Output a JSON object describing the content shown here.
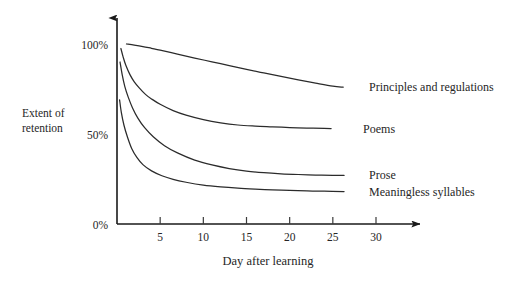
{
  "chart_data": {
    "type": "line",
    "title": "",
    "xlabel": "Day after learning",
    "ylabel_line1": "Extent of",
    "ylabel_line2": "retention",
    "xtick_labels": [
      "5",
      "10",
      "15",
      "20",
      "25",
      "30"
    ],
    "xticks": [
      5,
      10,
      15,
      20,
      25,
      30
    ],
    "ytick_labels": [
      "100%",
      "50%",
      "0%"
    ],
    "yticks": [
      100,
      50,
      0
    ],
    "xlim": [
      0,
      33
    ],
    "ylim": [
      0,
      100
    ],
    "grid": false,
    "legend_position": "right-inline",
    "axis_color": "#1a1a1a",
    "curve_color": "#2b2b2b",
    "background": "#ffffff",
    "series": [
      {
        "name": "Principles and regulations",
        "label": "Principles and regulations",
        "label_x": 29.2,
        "label_y": 76,
        "x": [
          1.1,
          2,
          3,
          4,
          5,
          7,
          9,
          11,
          13,
          15,
          17,
          19,
          21,
          23,
          25,
          26.2
        ],
        "values": [
          100,
          99.4,
          98.6,
          97.6,
          96.6,
          94.4,
          92.2,
          90.1,
          88,
          85.9,
          83.9,
          82,
          80.1,
          78.3,
          76.6,
          76
        ]
      },
      {
        "name": "Poems",
        "label": "Poems",
        "label_x": 28.5,
        "label_y": 53,
        "x": [
          0.45,
          0.7,
          1,
          1.5,
          2,
          2.6,
          3.3,
          4,
          5,
          6.5,
          8,
          10,
          12,
          14,
          16,
          18,
          20,
          22,
          24,
          24.8
        ],
        "values": [
          97.5,
          93,
          88.5,
          83,
          79,
          75.5,
          72,
          69.5,
          66.5,
          63,
          60.5,
          58,
          56.2,
          55,
          54.4,
          54,
          53.6,
          53.3,
          53.1,
          53
        ]
      },
      {
        "name": "Prose",
        "label": "Prose",
        "label_x": 29.2,
        "label_y": 27,
        "x": [
          0.35,
          0.6,
          0.9,
          1.3,
          1.8,
          2.4,
          3.2,
          4.2,
          5.5,
          7,
          9,
          11,
          13,
          15,
          17,
          19,
          21,
          23,
          25,
          26.3
        ],
        "values": [
          90,
          83,
          76.5,
          70.5,
          64.5,
          59,
          53.5,
          48.5,
          43.5,
          39.5,
          35.5,
          32.8,
          30.8,
          29.4,
          28.5,
          27.9,
          27.5,
          27.2,
          27.05,
          27
        ]
      },
      {
        "name": "Meaningless syllables",
        "label": "Meaningless syllables",
        "label_x": 29.2,
        "label_y": 18,
        "x": [
          0.3,
          0.5,
          0.8,
          1.2,
          1.7,
          2.3,
          3,
          4,
          5.2,
          6.5,
          8,
          10,
          12,
          14,
          16,
          18,
          20,
          22,
          24,
          26.3
        ],
        "values": [
          69,
          62,
          55,
          48.5,
          42,
          37,
          33,
          29.5,
          26.8,
          24.8,
          23.2,
          21.6,
          20.6,
          19.9,
          19.4,
          19,
          18.7,
          18.4,
          18.2,
          18
        ]
      }
    ]
  }
}
